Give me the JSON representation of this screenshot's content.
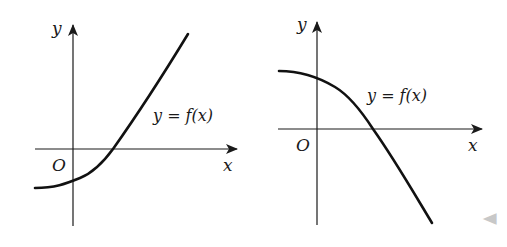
{
  "figures": [
    {
      "id": "left",
      "description": "Increasing convex function crossing x-axis to the right of origin, negative y-intercept",
      "axis_labels": {
        "x": "x",
        "y": "y",
        "origin": "O"
      },
      "curve_label": "y = f(x)"
    },
    {
      "id": "right",
      "description": "Decreasing concave function crossing x-axis to the right of origin, positive y-intercept",
      "axis_labels": {
        "x": "x",
        "y": "y",
        "origin": "O"
      },
      "curve_label": "y = f(x)"
    }
  ],
  "nav": {
    "prev_arrow": "◀"
  },
  "colors": {
    "ink": "#1a1a1a",
    "nav_arrow": "#c8c8c8"
  }
}
